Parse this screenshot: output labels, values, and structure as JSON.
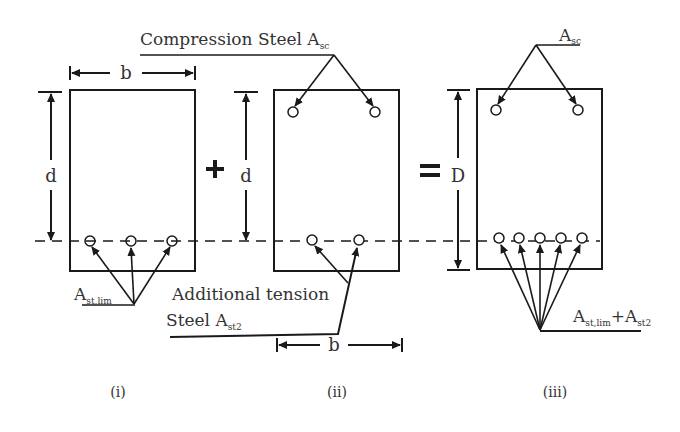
{
  "diagram": {
    "type": "doubly-reinforced-beam-section-superposition",
    "labels": {
      "compression_steel": "Compression Steel A",
      "compression_steel_sub": "sc",
      "asc_main": "A",
      "asc_sub": "sc",
      "ast_lim_main": "A",
      "ast_lim_sub": "st,lim",
      "additional_line1": "Additional tension",
      "additional_line2": "Steel A",
      "additional_sub": "st2",
      "sum_a1": "A",
      "sum_sub1": "st,lim",
      "sum_plus": "+A",
      "sum_sub2": "st2",
      "dim_b1": "b",
      "dim_b2": "b",
      "dim_d1": "d",
      "dim_d2": "d",
      "dim_D": "D",
      "plus_sign": "+",
      "equals_sign": "="
    },
    "captions": [
      "(i)",
      "(ii)",
      "(iii)"
    ],
    "sections": [
      {
        "id": "i",
        "tension_bars": 3,
        "compression_bars": 0
      },
      {
        "id": "ii",
        "tension_bars": 2,
        "compression_bars": 2
      },
      {
        "id": "iii",
        "tension_bars": 5,
        "compression_bars": 2
      }
    ],
    "colors": {
      "line": "#1a1a1a",
      "text": "#333333",
      "background": "#ffffff"
    }
  }
}
